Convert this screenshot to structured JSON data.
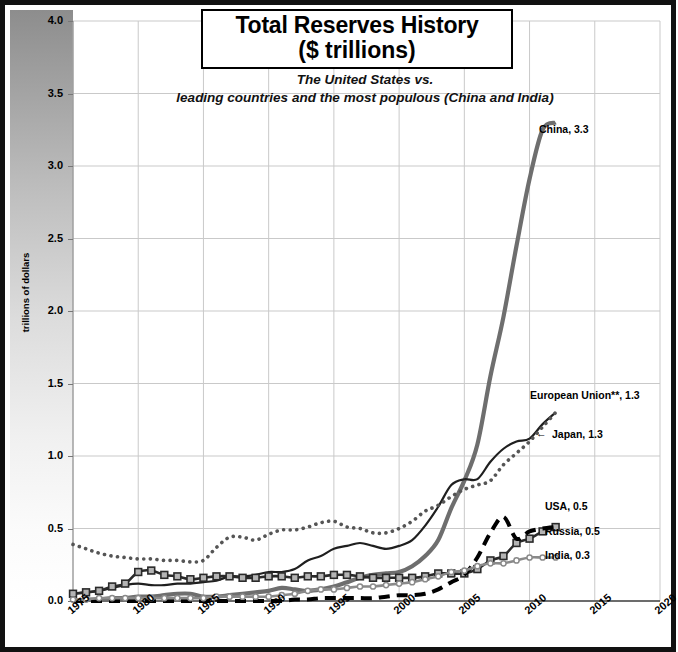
{
  "title": {
    "line1": "Total Reserves History",
    "line2": "($ trillions)"
  },
  "subtitle": {
    "line1": "The United States vs.",
    "line2": "leading countries and the most populous (China and India)"
  },
  "chart_data": {
    "type": "line",
    "title": "Total Reserves History ($ trillions)",
    "subtitle": "The United States vs. leading countries and the most populous (China and India)",
    "xlabel": "",
    "ylabel": "trillions of dollars",
    "xlim": [
      1975,
      2020
    ],
    "ylim": [
      0.0,
      4.0
    ],
    "grid": true,
    "legend_position": "right-inline-labels",
    "xticks": [
      "1975",
      "1980",
      "1985",
      "1990",
      "1995",
      "2000",
      "2005",
      "2010",
      "2015",
      "2020"
    ],
    "yticks": [
      "0.0",
      "0.5",
      "1.0",
      "1.5",
      "2.0",
      "2.5",
      "3.0",
      "3.5",
      "4.0"
    ],
    "x": [
      1975,
      1976,
      1977,
      1978,
      1979,
      1980,
      1981,
      1982,
      1983,
      1984,
      1985,
      1986,
      1987,
      1988,
      1989,
      1990,
      1991,
      1992,
      1993,
      1994,
      1995,
      1996,
      1997,
      1998,
      1999,
      2000,
      2001,
      2002,
      2003,
      2004,
      2005,
      2006,
      2007,
      2008,
      2009,
      2010,
      2011,
      2012
    ],
    "series": [
      {
        "name": "China",
        "label": "China, 3.3",
        "end_value": 3.3,
        "color": "#6e6e6e",
        "style": "solid-thick",
        "values": [
          0.0,
          0.01,
          0.01,
          0.02,
          0.02,
          0.03,
          0.03,
          0.04,
          0.05,
          0.05,
          0.03,
          0.03,
          0.04,
          0.05,
          0.06,
          0.07,
          0.09,
          0.08,
          0.07,
          0.08,
          0.1,
          0.13,
          0.16,
          0.18,
          0.19,
          0.2,
          0.24,
          0.31,
          0.42,
          0.64,
          0.83,
          1.08,
          1.55,
          1.96,
          2.45,
          2.91,
          3.25,
          3.3
        ]
      },
      {
        "name": "European Union**",
        "label": "European Union**, 1.3",
        "end_value": 1.3,
        "color": "#1f1f1f",
        "style": "solid-thin",
        "values": [
          0.05,
          0.06,
          0.07,
          0.09,
          0.11,
          0.12,
          0.11,
          0.11,
          0.12,
          0.12,
          0.13,
          0.14,
          0.17,
          0.17,
          0.18,
          0.2,
          0.2,
          0.22,
          0.28,
          0.31,
          0.36,
          0.38,
          0.4,
          0.38,
          0.36,
          0.38,
          0.42,
          0.52,
          0.65,
          0.8,
          0.84,
          0.84,
          0.96,
          1.05,
          1.1,
          1.12,
          1.22,
          1.3
        ]
      },
      {
        "name": "Japan",
        "label": "Japan, 1.3",
        "end_value": 1.3,
        "color": "#555555",
        "style": "dotted",
        "values": [
          0.39,
          0.36,
          0.33,
          0.31,
          0.3,
          0.29,
          0.29,
          0.28,
          0.28,
          0.27,
          0.28,
          0.37,
          0.44,
          0.44,
          0.42,
          0.46,
          0.49,
          0.49,
          0.51,
          0.54,
          0.55,
          0.51,
          0.5,
          0.47,
          0.47,
          0.5,
          0.55,
          0.62,
          0.66,
          0.72,
          0.77,
          0.8,
          0.83,
          0.94,
          1.02,
          1.1,
          1.2,
          1.3
        ]
      },
      {
        "name": "USA",
        "label": "USA, 0.5",
        "end_value": 0.5,
        "color": "#2a2a2a",
        "style": "markers-square",
        "values": [
          0.05,
          0.06,
          0.07,
          0.1,
          0.12,
          0.2,
          0.21,
          0.18,
          0.17,
          0.15,
          0.16,
          0.17,
          0.17,
          0.16,
          0.16,
          0.17,
          0.17,
          0.16,
          0.17,
          0.17,
          0.18,
          0.18,
          0.17,
          0.16,
          0.16,
          0.16,
          0.16,
          0.17,
          0.19,
          0.19,
          0.19,
          0.22,
          0.28,
          0.31,
          0.4,
          0.43,
          0.48,
          0.51
        ]
      },
      {
        "name": "Russia",
        "label": "Russia, 0.5",
        "end_value": 0.5,
        "color": "#000000",
        "style": "dashed-thick",
        "values": [
          0.0,
          0.0,
          0.0,
          0.0,
          0.0,
          0.0,
          0.0,
          0.0,
          0.0,
          0.0,
          0.0,
          0.0,
          0.0,
          0.0,
          0.0,
          0.0,
          0.0,
          0.01,
          0.01,
          0.02,
          0.02,
          0.02,
          0.02,
          0.02,
          0.03,
          0.04,
          0.04,
          0.05,
          0.08,
          0.13,
          0.18,
          0.3,
          0.47,
          0.58,
          0.43,
          0.48,
          0.5,
          0.51
        ]
      },
      {
        "name": "India",
        "label": "India, 0.3",
        "end_value": 0.3,
        "color": "#8a8a8a",
        "style": "markers-circle",
        "values": [
          0.01,
          0.01,
          0.02,
          0.02,
          0.02,
          0.02,
          0.02,
          0.02,
          0.02,
          0.02,
          0.02,
          0.03,
          0.03,
          0.03,
          0.03,
          0.03,
          0.04,
          0.05,
          0.07,
          0.08,
          0.08,
          0.09,
          0.1,
          0.1,
          0.11,
          0.12,
          0.13,
          0.15,
          0.17,
          0.2,
          0.21,
          0.24,
          0.26,
          0.26,
          0.28,
          0.3,
          0.3,
          0.3
        ]
      }
    ]
  },
  "axis_title": "trillions of dollars",
  "series_labels": [
    {
      "text": "China, 3.3",
      "left": 534,
      "top": 118
    },
    {
      "text": "European Union**, 1.3",
      "left": 525,
      "top": 384
    },
    {
      "text": "Japan, 1.3",
      "left": 547,
      "top": 423
    },
    {
      "text": "USA, 0.5",
      "left": 540,
      "top": 495
    },
    {
      "text": "Russia, 0.5",
      "left": 540,
      "top": 520
    },
    {
      "text": "India, 0.3",
      "left": 540,
      "top": 544
    },
    {
      "text": "←",
      "left": 531,
      "top": 422
    }
  ]
}
